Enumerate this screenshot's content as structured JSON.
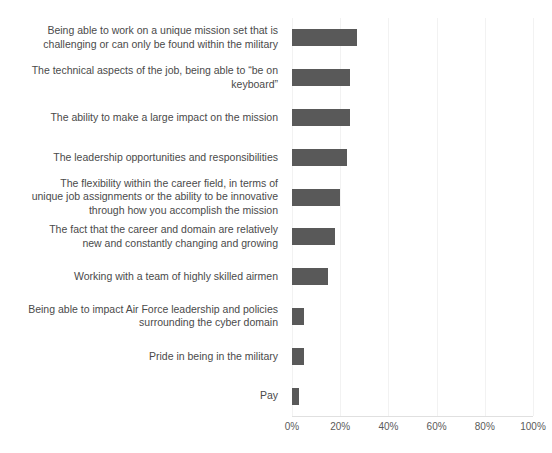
{
  "chart_data": {
    "type": "bar",
    "orientation": "horizontal",
    "title": "",
    "xlabel": "",
    "ylabel": "",
    "xlim": [
      0,
      100
    ],
    "xticks": [
      "0%",
      "20%",
      "40%",
      "60%",
      "80%",
      "100%"
    ],
    "xtick_values": [
      0,
      20,
      40,
      60,
      80,
      100
    ],
    "grid": true,
    "grid_axis": "x",
    "legend": false,
    "bar_color": "#595959",
    "gridline_color": "#f2f2f2",
    "axis_color": "#e0e0e0",
    "label_color": "#4a4a4a",
    "categories": [
      "Being able to work on a unique mission set that is challenging or can only be found within the military",
      "The technical aspects of the job, being able to “be on keyboard”",
      "The ability to make a large impact on the mission",
      "The leadership opportunities and responsibilities",
      "The flexibility within the career field, in terms of unique job assignments or the ability to be innovative through how you accomplish the mission",
      "The fact that the career and domain are relatively new and constantly changing and growing",
      "Working with a team of highly skilled airmen",
      "Being able to impact Air Force leadership and policies surrounding the cyber domain",
      "Pride in being in the military",
      "Pay"
    ],
    "category_lines": [
      [
        "Being able to work on a unique mission set that is",
        "challenging or can only be found within the military"
      ],
      [
        "The technical aspects of the job, being able to “be on",
        "keyboard”"
      ],
      [
        "The ability to make a large impact on the mission"
      ],
      [
        "The leadership opportunities and responsibilities"
      ],
      [
        "The flexibility within the career field, in terms of",
        "unique job assignments or the ability to be innovative",
        "through how you accomplish the mission"
      ],
      [
        "The fact that the career and domain are relatively",
        "new and constantly changing and growing"
      ],
      [
        "Working with a team of highly skilled airmen"
      ],
      [
        "Being able to impact Air Force leadership and policies",
        "surrounding the cyber domain"
      ],
      [
        "Pride in being in the military"
      ],
      [
        "Pay"
      ]
    ],
    "values": [
      27,
      24,
      24,
      23,
      20,
      18,
      15,
      5,
      5,
      3
    ]
  }
}
